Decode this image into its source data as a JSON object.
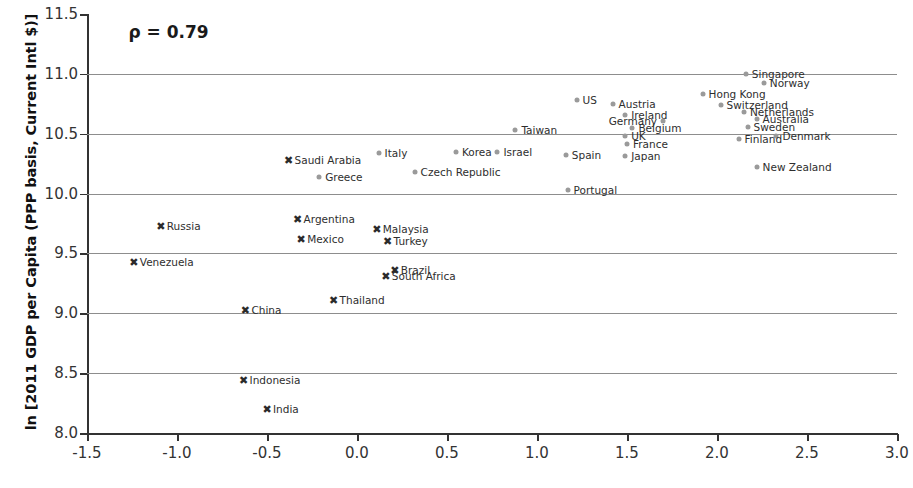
{
  "chart_data": {
    "type": "scatter",
    "title": "",
    "xlabel": "",
    "ylabel": "ln [2011 GDP per Capita (PPP basis, Current Intl $)]",
    "xlim": [
      -1.5,
      3.0
    ],
    "ylim": [
      8.0,
      11.5
    ],
    "xticks": [
      "-1.5",
      "-1.0",
      "-0.5",
      "0.0",
      "0.5",
      "1.0",
      "1.5",
      "2.0",
      "2.5",
      "3.0"
    ],
    "xtick_values": [
      -1.5,
      -1.0,
      -0.5,
      0.0,
      0.5,
      1.0,
      1.5,
      2.0,
      2.5,
      3.0
    ],
    "yticks": [
      "8.0",
      "8.5",
      "9.0",
      "9.5",
      "10.0",
      "10.5",
      "11.0",
      "11.5"
    ],
    "ytick_values": [
      8.0,
      8.5,
      9.0,
      9.5,
      10.0,
      10.5,
      11.0,
      11.5
    ],
    "gridlines_y": [
      8.5,
      9.0,
      9.5,
      10.0,
      10.5,
      11.0
    ],
    "grid": true,
    "legend": "none",
    "annotations": [
      {
        "text": "ρ = 0.79",
        "x": -1.27,
        "y": 11.35
      }
    ],
    "marker_styles": {
      "dot": {
        "shape": "circle",
        "color": "#9a9a9a",
        "group": "developed"
      },
      "cross": {
        "shape": "x",
        "color": "#2b2b2b",
        "group": "emerging"
      }
    },
    "points": [
      {
        "label": "Singapore",
        "x": 2.16,
        "y": 11.0,
        "marker": "dot",
        "label_side": "right"
      },
      {
        "label": "Norway",
        "x": 2.26,
        "y": 10.92,
        "marker": "dot",
        "label_side": "right"
      },
      {
        "label": "Hong Kong",
        "x": 1.92,
        "y": 10.83,
        "marker": "dot",
        "label_side": "right"
      },
      {
        "label": "US",
        "x": 1.22,
        "y": 10.78,
        "marker": "dot",
        "label_side": "right"
      },
      {
        "label": "Austria",
        "x": 1.42,
        "y": 10.75,
        "marker": "dot",
        "label_side": "right"
      },
      {
        "label": "Switzerland",
        "x": 2.02,
        "y": 10.74,
        "marker": "dot",
        "label_side": "right"
      },
      {
        "label": "Ireland",
        "x": 1.49,
        "y": 10.66,
        "marker": "dot",
        "label_side": "right"
      },
      {
        "label": "Netherlands",
        "x": 2.15,
        "y": 10.68,
        "marker": "dot",
        "label_side": "right"
      },
      {
        "label": "Germany",
        "x": 1.7,
        "y": 10.61,
        "marker": "dot",
        "label_side": "left"
      },
      {
        "label": "Australia",
        "x": 2.22,
        "y": 10.62,
        "marker": "dot",
        "label_side": "right"
      },
      {
        "label": "Belgium",
        "x": 1.53,
        "y": 10.55,
        "marker": "dot",
        "label_side": "right"
      },
      {
        "label": "Sweden",
        "x": 2.17,
        "y": 10.56,
        "marker": "dot",
        "label_side": "right"
      },
      {
        "label": "Taiwan",
        "x": 0.88,
        "y": 10.53,
        "marker": "dot",
        "label_side": "right"
      },
      {
        "label": "UK",
        "x": 1.49,
        "y": 10.48,
        "marker": "dot",
        "label_side": "right"
      },
      {
        "label": "Denmark",
        "x": 2.33,
        "y": 10.48,
        "marker": "dot",
        "label_side": "right"
      },
      {
        "label": "Finland",
        "x": 2.12,
        "y": 10.46,
        "marker": "dot",
        "label_side": "right"
      },
      {
        "label": "France",
        "x": 1.5,
        "y": 10.41,
        "marker": "dot",
        "label_side": "right"
      },
      {
        "label": "Korea",
        "x": 0.55,
        "y": 10.35,
        "marker": "dot",
        "label_side": "right"
      },
      {
        "label": "Israel",
        "x": 0.78,
        "y": 10.35,
        "marker": "dot",
        "label_side": "right"
      },
      {
        "label": "Spain",
        "x": 1.16,
        "y": 10.32,
        "marker": "dot",
        "label_side": "right"
      },
      {
        "label": "Italy",
        "x": 0.12,
        "y": 10.34,
        "marker": "dot",
        "label_side": "right"
      },
      {
        "label": "Japan",
        "x": 1.49,
        "y": 10.31,
        "marker": "dot",
        "label_side": "right"
      },
      {
        "label": "Saudi Arabia",
        "x": -0.38,
        "y": 10.28,
        "marker": "cross",
        "label_side": "right"
      },
      {
        "label": "New Zealand",
        "x": 2.22,
        "y": 10.22,
        "marker": "dot",
        "label_side": "right"
      },
      {
        "label": "Czech Republic",
        "x": 0.32,
        "y": 10.18,
        "marker": "dot",
        "label_side": "right"
      },
      {
        "label": "Greece",
        "x": -0.21,
        "y": 10.14,
        "marker": "dot",
        "label_side": "right"
      },
      {
        "label": "Portugal",
        "x": 1.17,
        "y": 10.03,
        "marker": "dot",
        "label_side": "right"
      },
      {
        "label": "Argentina",
        "x": -0.33,
        "y": 9.79,
        "marker": "cross",
        "label_side": "right"
      },
      {
        "label": "Russia",
        "x": -1.09,
        "y": 9.73,
        "marker": "cross",
        "label_side": "right"
      },
      {
        "label": "Malaysia",
        "x": 0.11,
        "y": 9.7,
        "marker": "cross",
        "label_side": "right"
      },
      {
        "label": "Mexico",
        "x": -0.31,
        "y": 9.62,
        "marker": "cross",
        "label_side": "right"
      },
      {
        "label": "Turkey",
        "x": 0.17,
        "y": 9.6,
        "marker": "cross",
        "label_side": "right"
      },
      {
        "label": "Venezuela",
        "x": -1.24,
        "y": 9.43,
        "marker": "cross",
        "label_side": "right"
      },
      {
        "label": "Brazil",
        "x": 0.21,
        "y": 9.36,
        "marker": "cross",
        "label_side": "right"
      },
      {
        "label": "South Africa",
        "x": 0.16,
        "y": 9.31,
        "marker": "cross",
        "label_side": "right"
      },
      {
        "label": "Thailand",
        "x": -0.13,
        "y": 9.11,
        "marker": "cross",
        "label_side": "right"
      },
      {
        "label": "China",
        "x": -0.62,
        "y": 9.03,
        "marker": "cross",
        "label_side": "right"
      },
      {
        "label": "Indonesia",
        "x": -0.63,
        "y": 8.44,
        "marker": "cross",
        "label_side": "right"
      },
      {
        "label": "India",
        "x": -0.5,
        "y": 8.2,
        "marker": "cross",
        "label_side": "right"
      }
    ]
  },
  "colors": {
    "dot": "#9a9a9a",
    "cross": "#2b2b2b",
    "grid": "#8d8d8d",
    "axis": "#333333",
    "text": "#2e2e2e"
  }
}
